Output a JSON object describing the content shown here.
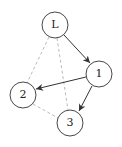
{
  "diagram": {
    "type": "graph",
    "nodes": [
      {
        "id": "L",
        "label": "L",
        "x": 55,
        "y": 25
      },
      {
        "id": "1",
        "label": "1",
        "x": 99,
        "y": 74
      },
      {
        "id": "2",
        "label": "2",
        "x": 23,
        "y": 95
      },
      {
        "id": "3",
        "label": "3",
        "x": 70,
        "y": 123
      }
    ],
    "edges": [
      {
        "from": "L",
        "to": "1",
        "style": "solid",
        "directed": true
      },
      {
        "from": "1",
        "to": "2",
        "style": "solid",
        "directed": true
      },
      {
        "from": "1",
        "to": "3",
        "style": "solid",
        "directed": true
      },
      {
        "from": "L",
        "to": "2",
        "style": "dashed",
        "directed": false
      },
      {
        "from": "L",
        "to": "3",
        "style": "dashed",
        "directed": false
      },
      {
        "from": "2",
        "to": "3",
        "style": "dashed",
        "directed": false
      }
    ],
    "colors": {
      "node_stroke": "#333333",
      "solid_edge": "#333333",
      "dashed_edge": "#aaaaaa"
    }
  }
}
